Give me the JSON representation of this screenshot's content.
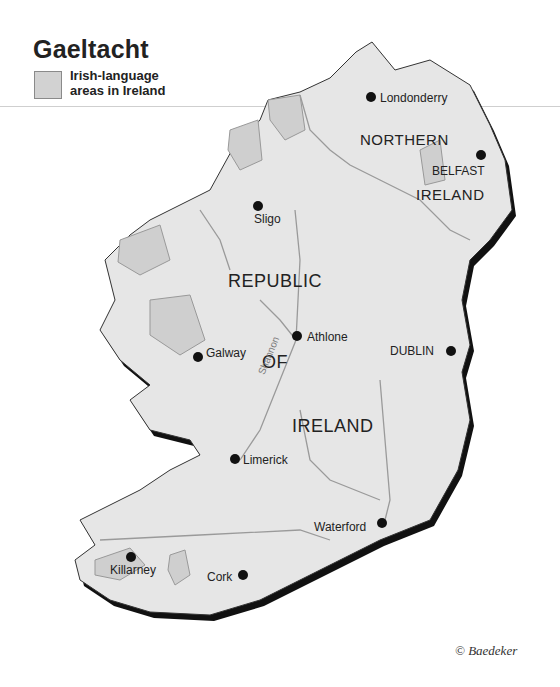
{
  "title": "Gaeltacht",
  "legend": {
    "label": "Irish-language areas in Ireland",
    "line1": "Irish-language",
    "line2": "areas in Ireland",
    "swatch_color": "#d2d2d2"
  },
  "regions": {
    "republic_1": "REPUBLIC",
    "republic_2": "OF",
    "republic_3": "IRELAND",
    "northern_1": "NORTHERN",
    "northern_2": "IRELAND"
  },
  "river": "Shannon",
  "cities": [
    {
      "name": "Londonderry"
    },
    {
      "name": "BELFAST"
    },
    {
      "name": "Sligo"
    },
    {
      "name": "Athlone"
    },
    {
      "name": "Galway"
    },
    {
      "name": "DUBLIN"
    },
    {
      "name": "Limerick"
    },
    {
      "name": "Waterford"
    },
    {
      "name": "Killarney"
    },
    {
      "name": "Cork"
    }
  ],
  "credit": "© Baedeker",
  "colors": {
    "land": "#e6e6e6",
    "gaeltacht": "#cfcfcf",
    "coast_shadow": "#111111",
    "borders": "#9a9a9a"
  }
}
